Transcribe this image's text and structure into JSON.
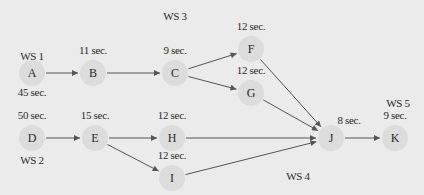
{
  "diagram": {
    "type": "precedence-diagram",
    "colors": {
      "background": "#ebebeb",
      "node": "#dcdcdc",
      "edge": "#555555",
      "text": "#2a2a2a"
    },
    "nodes": [
      {
        "id": "A",
        "time": "45 sec.",
        "x": 32,
        "y": 73,
        "time_pos": "below"
      },
      {
        "id": "B",
        "time": "11 sec.",
        "x": 93,
        "y": 73,
        "time_pos": "above"
      },
      {
        "id": "C",
        "time": "9 sec.",
        "x": 175,
        "y": 73,
        "time_pos": "above"
      },
      {
        "id": "F",
        "time": "12 sec.",
        "x": 251,
        "y": 49,
        "time_pos": "above"
      },
      {
        "id": "G",
        "time": "12 sec.",
        "x": 251,
        "y": 93,
        "time_pos": "above"
      },
      {
        "id": "D",
        "time": "50 sec.",
        "x": 32,
        "y": 138,
        "time_pos": "above"
      },
      {
        "id": "E",
        "time": "15 sec.",
        "x": 95,
        "y": 138,
        "time_pos": "above"
      },
      {
        "id": "H",
        "time": "12 sec.",
        "x": 172,
        "y": 138,
        "time_pos": "above"
      },
      {
        "id": "I",
        "time": "12 sec.",
        "x": 172,
        "y": 178,
        "time_pos": "above"
      },
      {
        "id": "J",
        "time": "8 sec.",
        "x": 331,
        "y": 138,
        "time_pos": "above-right"
      },
      {
        "id": "K",
        "time": "9 sec.",
        "x": 395,
        "y": 138,
        "time_pos": "above"
      }
    ],
    "edges": [
      [
        "A",
        "B"
      ],
      [
        "B",
        "C"
      ],
      [
        "C",
        "F"
      ],
      [
        "C",
        "G"
      ],
      [
        "F",
        "J"
      ],
      [
        "G",
        "J"
      ],
      [
        "D",
        "E"
      ],
      [
        "E",
        "H"
      ],
      [
        "E",
        "I"
      ],
      [
        "H",
        "J"
      ],
      [
        "I",
        "J"
      ],
      [
        "J",
        "K"
      ]
    ],
    "workstations": [
      {
        "label": "WS 1",
        "x": 32,
        "y": 57
      },
      {
        "label": "WS 2",
        "x": 32,
        "y": 161
      },
      {
        "label": "WS 3",
        "x": 175,
        "y": 17
      },
      {
        "label": "WS 4",
        "x": 298,
        "y": 177
      },
      {
        "label": "WS 5",
        "x": 398,
        "y": 104
      }
    ]
  }
}
